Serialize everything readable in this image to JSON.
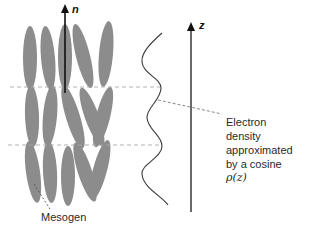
{
  "figure": {
    "director_label": "n",
    "axis_label": "z",
    "annotation_lines": [
      "Electron",
      "density",
      "approximated",
      "by a cosine"
    ],
    "annotation_formula": "ρ(z)",
    "mesogen_label": "Mesogen"
  },
  "colors": {
    "mesogen": "#8c8c8c",
    "axis": "#1a1a1a",
    "curve": "#3a3a3a",
    "dashed": "#a8a8a8"
  },
  "layers": {
    "count": 3,
    "boundaries_y": [
      87,
      145
    ]
  },
  "mesogens": [
    {
      "cx": 30,
      "cy": 58,
      "rx": 7,
      "ry": 32,
      "angle": 0
    },
    {
      "cx": 48,
      "cy": 58,
      "rx": 7,
      "ry": 32,
      "angle": -5
    },
    {
      "cx": 65,
      "cy": 57,
      "rx": 7,
      "ry": 33,
      "angle": 0
    },
    {
      "cx": 83,
      "cy": 56,
      "rx": 7,
      "ry": 33,
      "angle": -14
    },
    {
      "cx": 106,
      "cy": 54,
      "rx": 7,
      "ry": 33,
      "angle": 5
    },
    {
      "cx": 32,
      "cy": 116,
      "rx": 7,
      "ry": 31,
      "angle": -2
    },
    {
      "cx": 50,
      "cy": 116,
      "rx": 7,
      "ry": 31,
      "angle": 5
    },
    {
      "cx": 73,
      "cy": 117,
      "rx": 7,
      "ry": 33,
      "angle": -17
    },
    {
      "cx": 92,
      "cy": 117,
      "rx": 7,
      "ry": 31,
      "angle": -20
    },
    {
      "cx": 103,
      "cy": 117,
      "rx": 7,
      "ry": 31,
      "angle": 14
    },
    {
      "cx": 33,
      "cy": 172,
      "rx": 7,
      "ry": 31,
      "angle": -8
    },
    {
      "cx": 50,
      "cy": 172,
      "rx": 7,
      "ry": 31,
      "angle": -3
    },
    {
      "cx": 68,
      "cy": 176,
      "rx": 7,
      "ry": 30,
      "angle": 0
    },
    {
      "cx": 85,
      "cy": 172,
      "rx": 7,
      "ry": 31,
      "angle": -18
    },
    {
      "cx": 100,
      "cy": 170,
      "rx": 7,
      "ry": 31,
      "angle": 15
    }
  ]
}
